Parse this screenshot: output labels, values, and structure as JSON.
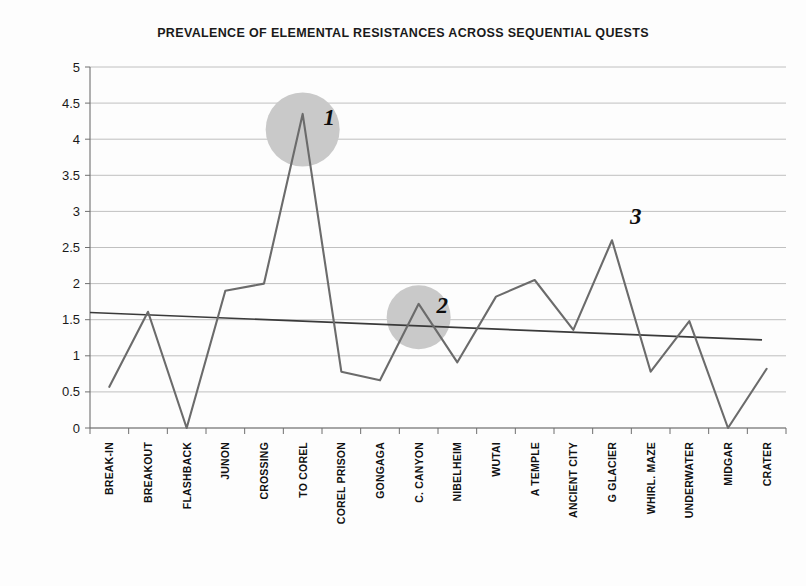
{
  "chart_data": {
    "type": "line",
    "title": "PREVALENCE OF ELEMENTAL RESISTANCES ACROSS SEQUENTIAL QUESTS",
    "xlabel": "",
    "ylabel": "",
    "ylim": [
      0,
      5
    ],
    "ytick_step": 0.5,
    "grid": true,
    "legend": "none",
    "categories": [
      "BREAK-IN",
      "BREAKOUT",
      "FLASHBACK",
      "JUNON",
      "CROSSING",
      "TO COREL",
      "COREL PRISON",
      "GONGAGA",
      "C. CANYON",
      "NIBELHEIM",
      "WUTAI",
      "A TEMPLE",
      "ANCIENT CITY",
      "G GLACIER",
      "WHIRL. MAZE",
      "UNDERWATER",
      "MIDGAR",
      "CRATER"
    ],
    "ytick_labels": [
      "5",
      "4.5",
      "4",
      "3.5",
      "3",
      "2.5",
      "2",
      "1.5",
      "1",
      "0.5",
      "0"
    ],
    "series": [
      {
        "name": "Elemental resistances",
        "type": "line",
        "color": "#6b6b6b",
        "values": [
          0.57,
          1.61,
          0.0,
          1.9,
          2.0,
          4.35,
          0.78,
          0.66,
          1.72,
          0.91,
          1.82,
          2.05,
          1.36,
          2.6,
          0.78,
          1.48,
          0.0,
          0.82
        ]
      },
      {
        "name": "Linear trend",
        "type": "trendline",
        "color": "#3a3a3a",
        "start_value": 1.6,
        "end_value": 1.22
      }
    ],
    "annotations": [
      {
        "label": "1",
        "category": "TO COREL",
        "value": 4.35,
        "marker": "grey-circle",
        "marker_color": "#c9c9c9",
        "marker_radius": 37
      },
      {
        "label": "2",
        "category": "C. CANYON",
        "value": 1.72,
        "marker": "grey-circle",
        "marker_color": "#c9c9c9",
        "marker_radius": 32
      },
      {
        "label": "3",
        "category": "G GLACIER",
        "value": 2.6,
        "marker": "none"
      }
    ]
  },
  "colors": {
    "background": "#fdfdfd",
    "gridline": "#b9b9b9",
    "axis": "#6f6f6f",
    "series": "#6b6b6b",
    "trend": "#3a3a3a",
    "highlight": "#c9c9c9",
    "text": "#111111"
  }
}
